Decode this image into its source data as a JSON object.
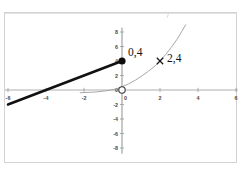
{
  "header": {
    "cut_text_left": "·········  ······  ·····",
    "cut_text_right": "··"
  },
  "figure": {
    "background_color": "#ffffff",
    "border_color": "#d2d2d6"
  },
  "chart_data": {
    "type": "line",
    "title": "",
    "subtitle": "",
    "xlabel": "",
    "ylabel": "",
    "xlim": [
      -6.8,
      6.6
    ],
    "ylim": [
      -8.8,
      8.6
    ],
    "grid": false,
    "legend": false,
    "axis_color": "#9a9a9a",
    "xticks": [
      -6,
      -4,
      -2,
      0,
      2,
      4,
      6
    ],
    "xtick_labels": [
      "-6",
      "-4",
      "-2",
      "0",
      "2",
      "4",
      "6"
    ],
    "yticks": [
      8,
      6,
      4,
      2,
      0,
      -2,
      -4,
      -6,
      -8
    ],
    "ytick_labels": [
      "8",
      "6",
      "4",
      "2",
      "0",
      "-2",
      "-4",
      "-6",
      "-8"
    ],
    "series": [
      {
        "name": "linear-segment",
        "type": "line",
        "color": "#111111",
        "width": 2.6,
        "points": [
          [
            -6,
            -2
          ],
          [
            0,
            4
          ]
        ]
      },
      {
        "name": "exponential-curve",
        "type": "curve",
        "color": "#9e9e9e",
        "width": 0.9,
        "points": [
          [
            -2.2,
            -0.38
          ],
          [
            -1.4,
            -0.28
          ],
          [
            -0.8,
            -0.1
          ],
          [
            -0.35,
            0.12
          ],
          [
            0,
            0.45
          ],
          [
            0.35,
            0.85
          ],
          [
            0.7,
            1.35
          ],
          [
            1.05,
            1.95
          ],
          [
            1.4,
            2.6
          ],
          [
            1.75,
            3.35
          ],
          [
            2.0,
            4.0
          ],
          [
            2.3,
            4.9
          ],
          [
            2.6,
            5.9
          ],
          [
            2.9,
            7.0
          ],
          [
            3.15,
            8.1
          ],
          [
            3.35,
            9.0
          ]
        ]
      }
    ],
    "markers": [
      {
        "name": "filled-point",
        "style": "filled-circle",
        "x": 0,
        "y": 4,
        "color": "#0d0d0d",
        "radius": 3.6,
        "label": "0,4",
        "label_dx": 6,
        "label_dy": -5
      },
      {
        "name": "open-point-origin",
        "style": "open-circle",
        "x": 0,
        "y": 0,
        "color": "#3a3a3a",
        "radius": 3.2,
        "label": "",
        "label_dx": 0,
        "label_dy": 0
      },
      {
        "name": "cross-point",
        "style": "cross",
        "x": 2,
        "y": 4,
        "color": "#1a1a1a",
        "radius": 3.2,
        "label": "2,4",
        "label_dx": 7,
        "label_dy": 1
      }
    ]
  }
}
